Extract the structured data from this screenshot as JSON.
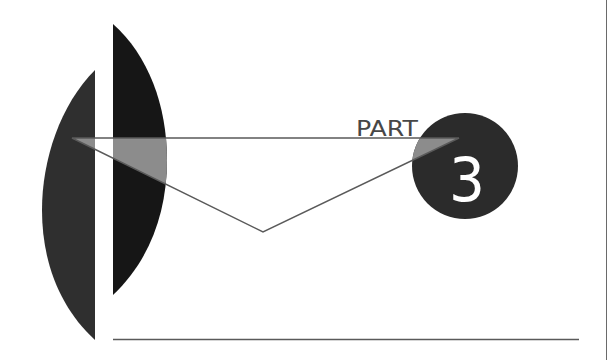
{
  "slide": {
    "label": "PART",
    "number": "3"
  },
  "colors": {
    "background": "#ffffff",
    "left_shape": "#2f2f2f",
    "right_shape": "#161616",
    "circle": "#2b2b2b",
    "overlap_fill": "#8c8c8c",
    "line": "#5a5a5a",
    "label_text": "#474747",
    "number_text": "#ffffff"
  }
}
